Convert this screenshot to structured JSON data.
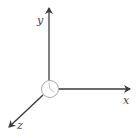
{
  "diagram": {
    "type": "3d-coordinate-axes",
    "colors": {
      "axis": "#3a3a3a",
      "label": "#444444",
      "origin_stroke": "#aaaaaa"
    },
    "axes": [
      {
        "name": "x",
        "label": "x"
      },
      {
        "name": "y",
        "label": "y"
      },
      {
        "name": "z",
        "label": "z"
      }
    ],
    "origin": {
      "symbol": "circle-with-hand"
    }
  }
}
